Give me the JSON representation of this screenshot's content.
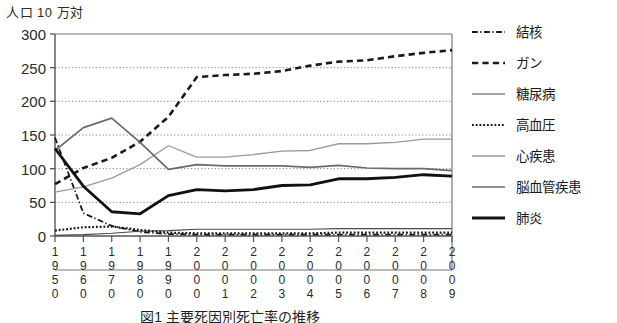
{
  "axis_unit_label": "人口 10 万対",
  "caption": "図1  主要死因別死亡率の推移",
  "yaxis": {
    "ticks": [
      "300",
      "250",
      "200",
      "150",
      "100",
      "50",
      "0"
    ],
    "min": 0,
    "max": 300,
    "step": 50
  },
  "xaxis": {
    "ticks": [
      "1950",
      "1960",
      "1970",
      "1980",
      "1990",
      "2000",
      "2001",
      "2002",
      "2003",
      "2004",
      "2005",
      "2006",
      "2007",
      "2008",
      "2009"
    ]
  },
  "legend": {
    "items": [
      {
        "label": "結核",
        "style": "dashdot",
        "color": "#1a1a1a",
        "width": 1.8
      },
      {
        "label": "ガン",
        "style": "dashed",
        "color": "#1a1a1a",
        "width": 2.6
      },
      {
        "label": "糖尿病",
        "style": "solid",
        "color": "#4a4a4a",
        "width": 1.1
      },
      {
        "label": "高血圧",
        "style": "dotted",
        "color": "#1a1a1a",
        "width": 2.2
      },
      {
        "label": "心疾患",
        "style": "solid",
        "color": "#9a9a9a",
        "width": 1.3
      },
      {
        "label": "脳血管疾患",
        "style": "solid",
        "color": "#6a6a6a",
        "width": 1.7
      },
      {
        "label": "肺炎",
        "style": "solid",
        "color": "#111111",
        "width": 2.8
      }
    ]
  },
  "chart_data": {
    "type": "line",
    "title": "図1  主要死因別死亡率の推移",
    "xlabel": "",
    "ylabel": "人口 10 万対",
    "ylim": [
      0,
      300
    ],
    "grid": true,
    "legend_position": "right",
    "categories": [
      "1950",
      "1960",
      "1970",
      "1980",
      "1990",
      "2000",
      "2001",
      "2002",
      "2003",
      "2004",
      "2005",
      "2006",
      "2007",
      "2008",
      "2009"
    ],
    "series": [
      {
        "name": "結核",
        "values": [
          146,
          34,
          15,
          6,
          3,
          2,
          2,
          2,
          2,
          2,
          2,
          2,
          2,
          2,
          2
        ]
      },
      {
        "name": "ガン",
        "values": [
          77,
          101,
          116,
          140,
          177,
          236,
          239,
          241,
          245,
          253,
          259,
          261,
          267,
          272,
          276
        ]
      },
      {
        "name": "糖尿病",
        "values": [
          1,
          2,
          4,
          7,
          8,
          10,
          10,
          10,
          10,
          10,
          11,
          11,
          11,
          11,
          11
        ]
      },
      {
        "name": "高血圧",
        "values": [
          8,
          13,
          14,
          9,
          5,
          4,
          4,
          4,
          4,
          4,
          5,
          5,
          5,
          5,
          5
        ]
      },
      {
        "name": "心疾患",
        "values": [
          65,
          73,
          86,
          106,
          134,
          117,
          117,
          121,
          126,
          127,
          137,
          137,
          139,
          144,
          144
        ]
      },
      {
        "name": "脳血管疾患",
        "values": [
          127,
          161,
          175,
          139,
          99,
          106,
          104,
          104,
          104,
          102,
          105,
          101,
          100,
          100,
          97
        ]
      },
      {
        "name": "肺炎",
        "values": [
          130,
          74,
          36,
          33,
          60,
          69,
          67,
          69,
          75,
          76,
          85,
          85,
          87,
          91,
          89
        ]
      }
    ]
  }
}
